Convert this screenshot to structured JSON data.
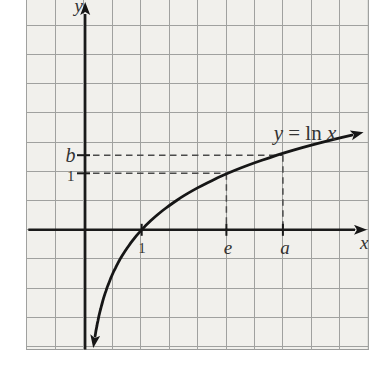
{
  "figure": {
    "y_axis_label": "y",
    "x_axis_label": "x",
    "curve_label": {
      "lhs": "y",
      "mid": " = ln ",
      "rhs": "x"
    },
    "x_tick_1": "1",
    "x_tick_e": "e",
    "x_tick_a": "a",
    "y_tick_b": "b",
    "y_tick_1": "1"
  },
  "chart_data": {
    "type": "line",
    "function": "y = ln x",
    "axes": {
      "x_label": "x",
      "y_label": "y",
      "grid": true
    },
    "x_ticks": [
      {
        "label": "1",
        "position": 1
      },
      {
        "label": "e",
        "position": 2.5
      },
      {
        "label": "a",
        "position": 3.5
      }
    ],
    "y_ticks": [
      {
        "label": "1",
        "position": 1
      },
      {
        "label": "b",
        "position": 1.32
      }
    ],
    "marked_points": [
      {
        "x": 2.5,
        "y": 1,
        "x_label": "e",
        "y_label": "1"
      },
      {
        "x": 3.5,
        "y": 1.32,
        "x_label": "a",
        "y_label": "b"
      }
    ],
    "curve": {
      "x_intercept": 1,
      "x_range_units": [
        0.175,
        4.72
      ]
    },
    "colors": {
      "curve": "#161616",
      "axis": "#1a1a1a",
      "grid": "#a0a19f",
      "paper": "#f1f0ec",
      "dashed": "#4a4a4a",
      "text": "#333333"
    }
  }
}
